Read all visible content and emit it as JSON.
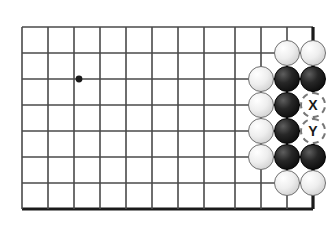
{
  "board": {
    "title": "Go board position diagram",
    "grid_spacing": 26,
    "origin_x": 22,
    "origin_y": 27,
    "columns": 12,
    "rows": 8,
    "line_color": "#4a4a4a",
    "edge_color": "#1a1a1a",
    "background_color": "#ffffff",
    "vertical_line_x": [
      22,
      48,
      74,
      100,
      126,
      152,
      178,
      204,
      235,
      261,
      287,
      313
    ],
    "horizontal_line_y": [
      27,
      53,
      79,
      105,
      131,
      157,
      183,
      209
    ],
    "right_edge_x": 313,
    "bottom_edge_y": 209,
    "star_points": [
      {
        "name": "hoshi",
        "x": 79,
        "y": 79,
        "radius": 3.4
      }
    ]
  },
  "stones": [
    {
      "name": "stone-white-c11-r2",
      "color": "white",
      "x": 287,
      "y": 53
    },
    {
      "name": "stone-white-c12-r2",
      "color": "white",
      "x": 313,
      "y": 53
    },
    {
      "name": "stone-white-c10-r3",
      "color": "white",
      "x": 261,
      "y": 79
    },
    {
      "name": "stone-black-c11-r3",
      "color": "black",
      "x": 287,
      "y": 79
    },
    {
      "name": "stone-black-c12-r3",
      "color": "black",
      "x": 313,
      "y": 79
    },
    {
      "name": "stone-white-c10-r4",
      "color": "white",
      "x": 261,
      "y": 105
    },
    {
      "name": "stone-black-c11-r4",
      "color": "black",
      "x": 287,
      "y": 105
    },
    {
      "name": "stone-white-c10-r5",
      "color": "white",
      "x": 261,
      "y": 131
    },
    {
      "name": "stone-black-c11-r5",
      "color": "black",
      "x": 287,
      "y": 131
    },
    {
      "name": "stone-white-c10-r6",
      "color": "white",
      "x": 261,
      "y": 157
    },
    {
      "name": "stone-black-c11-r6",
      "color": "black",
      "x": 287,
      "y": 157
    },
    {
      "name": "stone-black-c12-r6",
      "color": "black",
      "x": 313,
      "y": 157
    },
    {
      "name": "stone-white-c11-r7",
      "color": "white",
      "x": 287,
      "y": 183
    },
    {
      "name": "stone-white-c12-r7",
      "color": "white",
      "x": 313,
      "y": 183
    }
  ],
  "markers": [
    {
      "name": "marker-x",
      "label": "X",
      "x": 313,
      "y": 105
    },
    {
      "name": "marker-y",
      "label": "Y",
      "x": 313,
      "y": 131
    }
  ]
}
